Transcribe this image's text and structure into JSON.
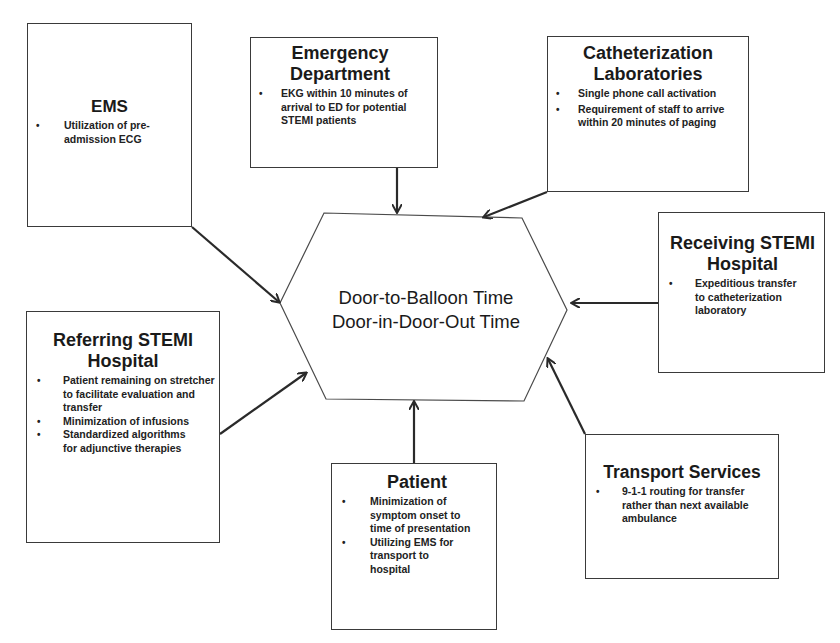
{
  "center": {
    "shape": "hexagon",
    "lines": [
      "Door-to-Balloon Time",
      "Door-in-Door-Out Time"
    ]
  },
  "boxes": {
    "ems": {
      "title": "EMS",
      "bullets": [
        "Utilization of pre-admission ECG"
      ]
    },
    "emergency_department": {
      "title": "Emergency Department",
      "bullets": [
        "EKG within 10 minutes of arrival to ED for potential STEMI patients"
      ]
    },
    "catheterization_laboratories": {
      "title": "Catheterization Laboratories",
      "bullets": [
        "Single phone call activation",
        "Requirement of staff to arrive within 20 minutes of paging"
      ]
    },
    "receiving_stemi_hospital": {
      "title": "Receiving STEMI Hospital",
      "bullets": [
        "Expeditious transfer to catheterization laboratory"
      ]
    },
    "referring_stemi_hospital": {
      "title": "Referring STEMI Hospital",
      "bullets": [
        "Patient remaining on stretcher to facilitate evaluation and transfer",
        "Minimization of infusions",
        "Standardized algorithms for adjunctive therapies"
      ]
    },
    "patient": {
      "title": "Patient",
      "bullets": [
        "Minimization of symptom onset to time of presentation",
        "Utilizing EMS for transport to hospital"
      ]
    },
    "transport_services": {
      "title": "Transport Services",
      "bullets": [
        "9-1-1 routing for transfer rather than next available ambulance"
      ]
    }
  },
  "bullet_glyph": "•",
  "colors": {
    "line": "#2a2a2a",
    "border": "#3a3a3a",
    "text": "#1a1a1a",
    "background": "#ffffff"
  }
}
